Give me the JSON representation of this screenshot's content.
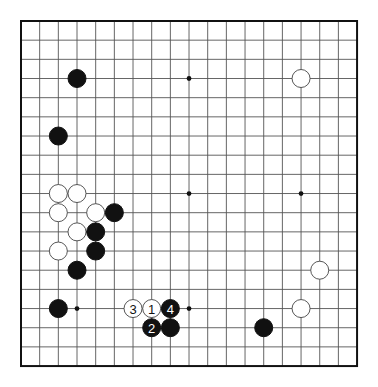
{
  "board": {
    "size": 19,
    "origin_x": 21,
    "origin_y": 21,
    "spacing_x": 18.67,
    "spacing_y": 19.17,
    "stone_radius": 9,
    "line_color": "#555555",
    "border_color": "#111111",
    "background": "#ffffff"
  },
  "star_points": [
    [
      3,
      3
    ],
    [
      9,
      3
    ],
    [
      15,
      3
    ],
    [
      3,
      9
    ],
    [
      9,
      9
    ],
    [
      15,
      9
    ],
    [
      3,
      15
    ],
    [
      9,
      15
    ],
    [
      15,
      15
    ]
  ],
  "stones": [
    {
      "color": "black",
      "col": 3,
      "row": 3
    },
    {
      "color": "white",
      "col": 15,
      "row": 3
    },
    {
      "color": "black",
      "col": 2,
      "row": 6
    },
    {
      "color": "white",
      "col": 2,
      "row": 9
    },
    {
      "color": "white",
      "col": 3,
      "row": 9
    },
    {
      "color": "white",
      "col": 2,
      "row": 10
    },
    {
      "color": "white",
      "col": 4,
      "row": 10
    },
    {
      "color": "black",
      "col": 5,
      "row": 10
    },
    {
      "color": "white",
      "col": 3,
      "row": 11
    },
    {
      "color": "black",
      "col": 4,
      "row": 11
    },
    {
      "color": "white",
      "col": 2,
      "row": 12
    },
    {
      "color": "black",
      "col": 4,
      "row": 12
    },
    {
      "color": "black",
      "col": 3,
      "row": 13
    },
    {
      "color": "white",
      "col": 16,
      "row": 13
    },
    {
      "color": "black",
      "col": 2,
      "row": 15
    },
    {
      "color": "white",
      "col": 6,
      "row": 15,
      "label": "3"
    },
    {
      "color": "white",
      "col": 7,
      "row": 15,
      "label": "1"
    },
    {
      "color": "black",
      "col": 8,
      "row": 15,
      "label": "4"
    },
    {
      "color": "white",
      "col": 15,
      "row": 15
    },
    {
      "color": "black",
      "col": 7,
      "row": 16,
      "label": "2"
    },
    {
      "color": "black",
      "col": 8,
      "row": 16
    },
    {
      "color": "black",
      "col": 13,
      "row": 16
    }
  ]
}
